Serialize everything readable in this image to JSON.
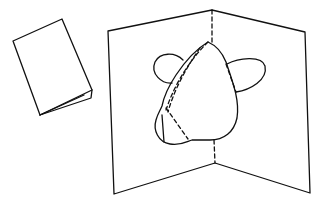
{
  "figure": {
    "description": "Line drawing of a pop-up card: a closed folded card and an open card with a pop-up mouse head",
    "stroke_color": "#111111",
    "background": "#ffffff"
  },
  "parts": {
    "closed_card": {
      "label": "closed folded card"
    },
    "open_card": {
      "label": "open pop-up card"
    },
    "popup_head": {
      "label": "pop-up mouse head with two ears"
    },
    "fold_line": {
      "label": "center fold (dashed)"
    }
  }
}
